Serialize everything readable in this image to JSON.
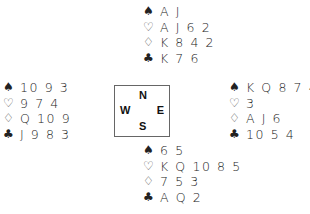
{
  "suit_symbols": {
    "spades": "♠",
    "hearts": "♡",
    "diamonds": "♢",
    "clubs": "♣"
  },
  "hands": {
    "north": {
      "spades": "A J",
      "hearts": "A J 6 2",
      "diamonds": "K 8 4 2",
      "clubs": "K 7 6"
    },
    "west": {
      "spades": "10 9 3",
      "hearts": "9 7 4",
      "diamonds": "Q 10 9",
      "clubs": "J 9 8 3"
    },
    "east": {
      "spades": "K Q 8 7 4 2",
      "hearts": "3",
      "diamonds": "A J 6",
      "clubs": "10 5 4"
    },
    "south": {
      "spades": "6 5",
      "hearts": "K Q 10 8 5",
      "diamonds": "7 5 3",
      "clubs": "A Q 2"
    }
  },
  "compass": {
    "n": "N",
    "w": "W",
    "e": "E",
    "s": "S"
  }
}
